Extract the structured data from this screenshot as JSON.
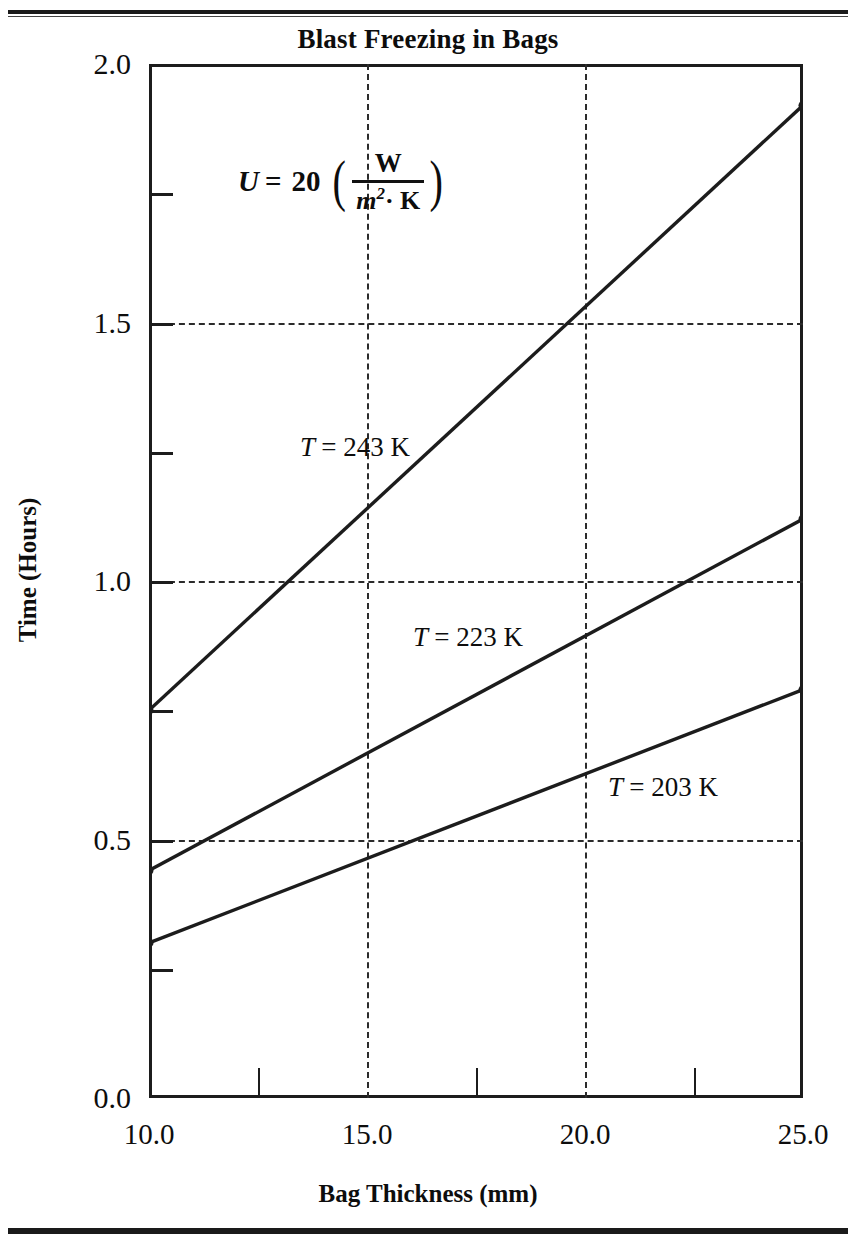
{
  "figure": {
    "title": "Blast Freezing in Bags",
    "annotation": {
      "lhs": "U",
      "equals": "=",
      "value": "20",
      "open_paren": "(",
      "numerator": "W",
      "denominator_base": "m",
      "denominator_exp": "2",
      "denominator_dot": "· K",
      "close_paren": ")"
    }
  },
  "axes": {
    "x": {
      "title": "Bag Thickness (mm)",
      "ticks": [
        "10.0",
        "15.0",
        "20.0",
        "25.0"
      ],
      "tick_values": [
        10.0,
        15.0,
        20.0,
        25.0
      ],
      "minor_tick_values": [
        12.5,
        17.5,
        22.5
      ],
      "range": [
        10.0,
        25.0
      ]
    },
    "y": {
      "title": "Time (Hours)",
      "ticks": [
        "0.0",
        "0.5",
        "1.0",
        "1.5",
        "2.0"
      ],
      "tick_values": [
        0.0,
        0.5,
        1.0,
        1.5,
        2.0
      ],
      "minor_tick_values": [
        0.25,
        0.75,
        1.25,
        1.75
      ],
      "range": [
        0.0,
        2.0
      ]
    }
  },
  "series_labels": [
    {
      "name": "T = 243 K",
      "var": "T",
      "rest": "= 243 K",
      "left": 300,
      "top": 432
    },
    {
      "name": "T = 223 K",
      "var": "T",
      "rest": "= 223 K",
      "left": 413,
      "top": 622
    },
    {
      "name": "T = 203 K",
      "var": "T",
      "rest": "= 203  K",
      "left": 608,
      "top": 772
    }
  ],
  "colors": {
    "ink": "#1c1c1c",
    "grid": "#2b2b2b",
    "background": "#ffffff"
  },
  "chart_data": {
    "type": "line",
    "title": "Blast Freezing in Bags",
    "xlabel": "Bag Thickness (mm)",
    "ylabel": "Time (Hours)",
    "xlim": [
      10.0,
      25.0
    ],
    "ylim": [
      0.0,
      2.0
    ],
    "grid": true,
    "grid_x_values": [
      15.0,
      20.0
    ],
    "grid_y_values": [
      0.5,
      1.0,
      1.5
    ],
    "legend": "inline-annotations",
    "annotation": "U = 20 (W / m²·K)",
    "x": [
      10.0,
      25.0
    ],
    "series": [
      {
        "name": "T = 243 K",
        "temperature_K": 243,
        "values": [
          0.75,
          1.92
        ]
      },
      {
        "name": "T = 223 K",
        "temperature_K": 223,
        "values": [
          0.44,
          1.12
        ]
      },
      {
        "name": "T = 203 K",
        "temperature_K": 203,
        "values": [
          0.3,
          0.79
        ]
      }
    ]
  }
}
